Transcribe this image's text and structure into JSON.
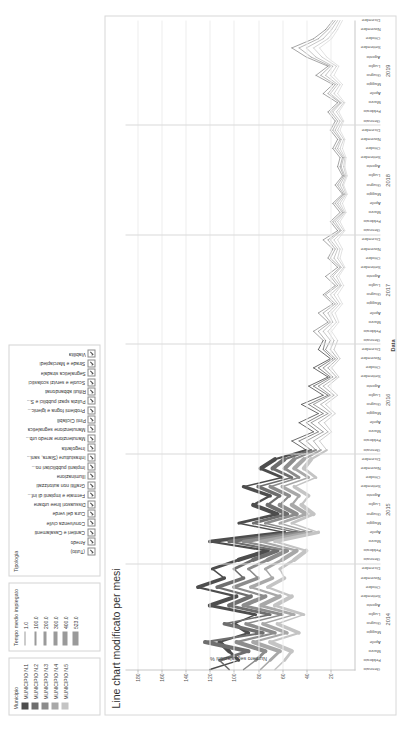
{
  "legends": {
    "municipio": {
      "title": "Municipio",
      "items": [
        {
          "label": "MUNICIPIO N.1",
          "color": "#4d4d4d"
        },
        {
          "label": "MUNICIPIO N.2",
          "color": "#6e6e6e"
        },
        {
          "label": "MUNICIPIO N.3",
          "color": "#8c8c8c"
        },
        {
          "label": "MUNICIPIO N.4",
          "color": "#a8a8a8"
        },
        {
          "label": "MUNICIPIO N.5",
          "color": "#c4c4c4"
        }
      ]
    },
    "tempo": {
      "title": "Tempo medio impiegato",
      "items": [
        {
          "label": "1.0",
          "width": 1
        },
        {
          "label": "100.0",
          "width": 2
        },
        {
          "label": "200.0",
          "width": 3
        },
        {
          "label": "300.0",
          "width": 4
        },
        {
          "label": "400.0",
          "width": 5
        },
        {
          "label": "523.0",
          "width": 6
        }
      ]
    },
    "tipologia": {
      "title": "Tipologia",
      "items": [
        "(Tutto)",
        "Arredo",
        "Cantieri e Casalamenti",
        "Convivenza civile",
        "Cura del verde",
        "Dissuasori linee urbane",
        "Fermate e impianti di inf...",
        "Graffiti non autorizzati",
        "Illuminazione",
        "Impianti pubblicitari no...",
        "Infrastutture (Siarra, sani...",
        "Irregolarita",
        "Manutenzione arredo urb...",
        "Manutenzione segnaletica",
        "Pinti Cicilabili",
        "Problemi fogna e igienic...",
        "Pulizia spazi pubblici e S...",
        "Rifiuti abbandonati",
        "Scuole e servizi scolastici",
        "Segnaletica stradale",
        "Strade e Marciapiedi",
        "Viabilita"
      ]
    }
  },
  "chart_data": {
    "type": "line",
    "title": "Line chart modificato per mesi",
    "xlabel": "Data",
    "ylabel": "Numero segnalazioni %",
    "ylim": [
      0,
      190
    ],
    "yticks": [
      180,
      160,
      140,
      120,
      100,
      80,
      60,
      40,
      20
    ],
    "grid": true,
    "legend_position": "top",
    "years": [
      "2014",
      "2015",
      "2016",
      "2017",
      "2018",
      "2019"
    ],
    "months": [
      "Gennaio",
      "Febbraio",
      "Marzo",
      "Aprile",
      "Maggio",
      "Giugno",
      "Luglio",
      "Agosto",
      "Settembre",
      "Ottobre",
      "Novembre",
      "Dicembre"
    ],
    "series": [
      {
        "name": "MUNICIPIO N.1",
        "color": "#4d4d4d",
        "values": [
          120,
          96,
          104,
          112,
          88,
          100,
          82,
          120,
          98,
          130,
          108,
          118,
          96,
          72,
          120,
          58,
          96,
          64,
          84,
          70,
          92,
          60,
          78,
          66,
          40,
          52,
          34,
          46,
          30,
          44,
          26,
          38,
          22,
          34,
          20,
          30,
          26,
          34,
          22,
          30,
          18,
          26,
          16,
          24,
          14,
          22,
          18,
          26,
          14,
          20,
          12,
          18,
          10,
          16,
          10,
          14,
          12,
          18,
          14,
          20,
          16,
          22,
          14,
          26,
          18,
          32,
          22,
          40,
          52,
          34,
          24,
          18
        ]
      },
      {
        "name": "MUNICIPIO N.2",
        "color": "#6e6e6e",
        "values": [
          104,
          112,
          88,
          124,
          76,
          108,
          70,
          104,
          86,
          114,
          92,
          100,
          84,
          64,
          104,
          48,
          84,
          56,
          72,
          62,
          80,
          52,
          68,
          58,
          36,
          46,
          30,
          40,
          26,
          38,
          22,
          34,
          20,
          30,
          18,
          26,
          24,
          30,
          20,
          26,
          16,
          24,
          14,
          20,
          12,
          20,
          16,
          22,
          12,
          18,
          10,
          16,
          9,
          14,
          9,
          12,
          10,
          16,
          12,
          18,
          14,
          20,
          12,
          22,
          16,
          28,
          20,
          36,
          46,
          30,
          22,
          16
        ]
      },
      {
        "name": "MUNICIPIO N.3",
        "color": "#8c8c8c",
        "values": [
          92,
          82,
          74,
          98,
          66,
          90,
          60,
          92,
          74,
          100,
          80,
          88,
          72,
          56,
          92,
          42,
          74,
          48,
          62,
          54,
          70,
          46,
          58,
          50,
          32,
          40,
          26,
          36,
          22,
          34,
          20,
          30,
          18,
          26,
          16,
          24,
          20,
          26,
          18,
          22,
          14,
          20,
          12,
          18,
          11,
          17,
          14,
          20,
          11,
          16,
          9,
          14,
          8,
          12,
          8,
          11,
          9,
          14,
          11,
          16,
          12,
          18,
          11,
          20,
          14,
          24,
          18,
          32,
          40,
          26,
          19,
          14
        ]
      },
      {
        "name": "MUNICIPIO N.4",
        "color": "#a8a8a8",
        "values": [
          78,
          70,
          62,
          84,
          56,
          76,
          50,
          78,
          62,
          86,
          68,
          74,
          60,
          48,
          78,
          36,
          62,
          40,
          52,
          46,
          60,
          38,
          50,
          42,
          28,
          34,
          22,
          30,
          19,
          28,
          17,
          26,
          15,
          22,
          14,
          20,
          17,
          22,
          15,
          19,
          12,
          17,
          11,
          15,
          9,
          14,
          12,
          17,
          9,
          14,
          8,
          12,
          7,
          10,
          7,
          9,
          8,
          12,
          9,
          14,
          10,
          15,
          9,
          17,
          12,
          20,
          15,
          27,
          34,
          22,
          16,
          12
        ]
      },
      {
        "name": "MUNICIPIO N.5",
        "color": "#c4c4c4",
        "values": [
          66,
          58,
          52,
          70,
          46,
          64,
          42,
          66,
          52,
          72,
          58,
          62,
          50,
          40,
          66,
          30,
          52,
          34,
          44,
          38,
          50,
          32,
          42,
          36,
          23,
          29,
          19,
          25,
          16,
          24,
          14,
          22,
          13,
          19,
          12,
          17,
          14,
          19,
          13,
          16,
          10,
          14,
          9,
          13,
          8,
          12,
          10,
          14,
          8,
          12,
          7,
          10,
          6,
          9,
          6,
          8,
          7,
          10,
          8,
          12,
          9,
          13,
          8,
          14,
          10,
          17,
          13,
          23,
          29,
          19,
          14,
          10
        ]
      }
    ]
  }
}
